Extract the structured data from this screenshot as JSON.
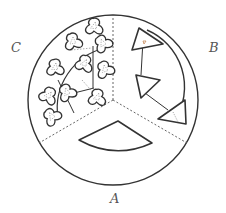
{
  "diagram": {
    "type": "sector-partitioned-circle",
    "labels": {
      "a": "A",
      "b": "B",
      "c": "C"
    },
    "sectors": [
      {
        "id": "A",
        "position": "bottom",
        "content": "single annular-sector shape"
      },
      {
        "id": "B",
        "position": "upper-right",
        "content": "three triangles connected by lines, arranged along an arc"
      },
      {
        "id": "C",
        "position": "upper-left",
        "content": "many three-lobed blob shapes connected by lines, arranged along arcs"
      }
    ],
    "colors": {
      "stroke": "#333333",
      "divider": "#555555",
      "label": "#555555",
      "background": "#ffffff"
    }
  }
}
